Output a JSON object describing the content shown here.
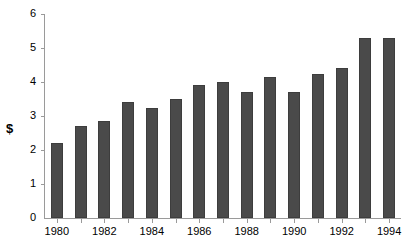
{
  "chart_data": {
    "type": "bar",
    "title": "",
    "xlabel": "",
    "ylabel": "$",
    "categories": [
      "1980",
      "1981",
      "1982",
      "1983",
      "1984",
      "1985",
      "1986",
      "1987",
      "1988",
      "1989",
      "1990",
      "1991",
      "1992",
      "1993",
      "1994"
    ],
    "values": [
      2.2,
      2.7,
      2.85,
      3.4,
      3.25,
      3.5,
      3.9,
      4.0,
      3.7,
      4.15,
      3.7,
      4.25,
      4.4,
      5.3,
      5.3
    ],
    "ylim": [
      0,
      6
    ],
    "yticks": [
      0,
      1,
      2,
      3,
      4,
      5,
      6
    ],
    "ytick_labels": [
      "0",
      "1",
      "2",
      "3",
      "4",
      "5",
      "6"
    ],
    "xtick_labels_shown": [
      "1980",
      "1982",
      "1984",
      "1986",
      "1988",
      "1990",
      "1992",
      "1994"
    ],
    "grid": false,
    "legend": null,
    "bar_color": "#4a4a4a",
    "axis_color": "#9a9a9a",
    "background_color": "#ffffff"
  },
  "axis": {
    "y_title": "$"
  }
}
